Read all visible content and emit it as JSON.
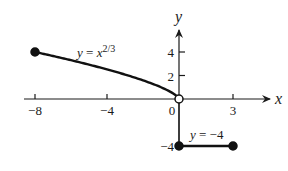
{
  "chart_data": {
    "type": "line",
    "title": "",
    "xlabel": "x",
    "ylabel": "y",
    "xlim": [
      -9.5,
      5
    ],
    "ylim": [
      -5,
      7
    ],
    "grid": false,
    "x_ticks": [
      -8,
      -4,
      0,
      3
    ],
    "x_tick_labels": [
      "−8",
      "−4",
      "0",
      "3"
    ],
    "y_ticks": [
      4,
      2,
      -4
    ],
    "y_tick_labels": [
      "4",
      "2",
      "−4"
    ],
    "series": [
      {
        "name": "y = x^(2/3)",
        "label": "y = x",
        "label_exponent": "2/3",
        "domain": [
          -8,
          0
        ],
        "x": [
          -8,
          -7,
          -6,
          -5,
          -4,
          -3,
          -2,
          -1,
          -0.5,
          0
        ],
        "values": [
          4,
          3.66,
          3.3,
          2.92,
          2.52,
          2.08,
          1.59,
          1.0,
          0.63,
          0
        ],
        "start_point": {
          "x": -8,
          "y": 4,
          "style": "closed"
        },
        "end_point": {
          "x": 0,
          "y": 0,
          "style": "open"
        }
      },
      {
        "name": "y = -4",
        "label": "y = −4",
        "domain": [
          0,
          3
        ],
        "x": [
          0,
          3
        ],
        "values": [
          -4,
          -4
        ],
        "start_point": {
          "x": 0,
          "y": -4,
          "style": "closed"
        },
        "end_point": {
          "x": 3,
          "y": -4,
          "style": "closed"
        }
      }
    ],
    "annotations": [
      {
        "text": "y = x^(2/3)",
        "near": {
          "x": -5.5,
          "y": 4.5
        }
      },
      {
        "text": "y = −4",
        "near": {
          "x": 1.5,
          "y": -3
        }
      }
    ],
    "vertical_segment": {
      "x": 0,
      "from_y": 0,
      "to_y": -4
    }
  }
}
